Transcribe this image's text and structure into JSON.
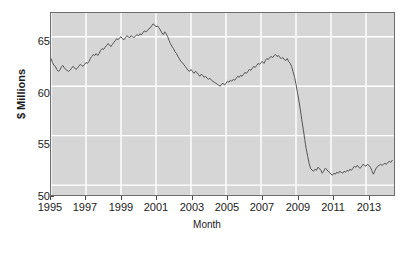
{
  "chart_data": {
    "type": "line",
    "title": "",
    "xlabel": "Month",
    "ylabel": "$ Millions",
    "xlim": [
      1995.0,
      2014.6
    ],
    "ylim": [
      49.0,
      67.4
    ],
    "grid": true,
    "legend": null,
    "x_ticks": [
      "1995",
      "1997",
      "1999",
      "2001",
      "2003",
      "2005",
      "2007",
      "2009",
      "2011",
      "2013"
    ],
    "x_tick_values": [
      1995,
      1997,
      1999,
      2001,
      2003,
      2005,
      2007,
      2009,
      2011,
      2013
    ],
    "y_ticks": [
      "50",
      "55",
      "60",
      "65"
    ],
    "y_tick_values": [
      50,
      55,
      60,
      65
    ],
    "series": [
      {
        "name": "Monthly value",
        "color": "#555555",
        "x": [
          1995.0,
          1995.08,
          1995.17,
          1995.25,
          1995.33,
          1995.42,
          1995.5,
          1995.58,
          1995.67,
          1995.75,
          1995.83,
          1995.92,
          1996.0,
          1996.08,
          1996.17,
          1996.25,
          1996.33,
          1996.42,
          1996.5,
          1996.58,
          1996.67,
          1996.75,
          1996.83,
          1996.92,
          1997.0,
          1997.08,
          1997.17,
          1997.25,
          1997.33,
          1997.42,
          1997.5,
          1997.58,
          1997.67,
          1997.75,
          1997.83,
          1997.92,
          1998.0,
          1998.08,
          1998.17,
          1998.25,
          1998.33,
          1998.42,
          1998.5,
          1998.58,
          1998.67,
          1998.75,
          1998.83,
          1998.92,
          1999.0,
          1999.08,
          1999.17,
          1999.25,
          1999.33,
          1999.42,
          1999.5,
          1999.58,
          1999.67,
          1999.75,
          1999.83,
          1999.92,
          2000.0,
          2000.08,
          2000.17,
          2000.25,
          2000.33,
          2000.42,
          2000.5,
          2000.58,
          2000.67,
          2000.75,
          2000.83,
          2000.92,
          2001.0,
          2001.08,
          2001.17,
          2001.25,
          2001.33,
          2001.42,
          2001.5,
          2001.58,
          2001.67,
          2001.75,
          2001.83,
          2001.92,
          2002.0,
          2002.08,
          2002.17,
          2002.25,
          2002.33,
          2002.42,
          2002.5,
          2002.58,
          2002.67,
          2002.75,
          2002.83,
          2002.92,
          2003.0,
          2003.08,
          2003.17,
          2003.25,
          2003.33,
          2003.42,
          2003.5,
          2003.58,
          2003.67,
          2003.75,
          2003.83,
          2003.92,
          2004.0,
          2004.08,
          2004.17,
          2004.25,
          2004.33,
          2004.42,
          2004.5,
          2004.58,
          2004.67,
          2004.75,
          2004.83,
          2004.92,
          2005.0,
          2005.08,
          2005.17,
          2005.25,
          2005.33,
          2005.42,
          2005.5,
          2005.58,
          2005.67,
          2005.75,
          2005.83,
          2005.92,
          2006.0,
          2006.08,
          2006.17,
          2006.25,
          2006.33,
          2006.42,
          2006.5,
          2006.58,
          2006.67,
          2006.75,
          2006.83,
          2006.92,
          2007.0,
          2007.08,
          2007.17,
          2007.25,
          2007.33,
          2007.42,
          2007.5,
          2007.58,
          2007.67,
          2007.75,
          2007.83,
          2007.92,
          2008.0,
          2008.08,
          2008.17,
          2008.25,
          2008.33,
          2008.42,
          2008.5,
          2008.58,
          2008.67,
          2008.75,
          2008.83,
          2008.92,
          2009.0,
          2009.08,
          2009.17,
          2009.25,
          2009.33,
          2009.42,
          2009.5,
          2009.58,
          2009.67,
          2009.75,
          2009.83,
          2009.92,
          2010.0,
          2010.08,
          2010.17,
          2010.25,
          2010.33,
          2010.42,
          2010.5,
          2010.58,
          2010.67,
          2010.75,
          2010.83,
          2010.92,
          2011.0,
          2011.08,
          2011.17,
          2011.25,
          2011.33,
          2011.42,
          2011.5,
          2011.58,
          2011.67,
          2011.75,
          2011.83,
          2011.92,
          2012.0,
          2012.08,
          2012.17,
          2012.25,
          2012.33,
          2012.42,
          2012.5,
          2012.58,
          2012.67,
          2012.75,
          2012.83,
          2012.92,
          2013.0,
          2013.08,
          2013.17,
          2013.25,
          2013.33,
          2013.42,
          2013.5,
          2013.58,
          2013.67,
          2013.75,
          2013.83,
          2013.92,
          2014.0,
          2014.08,
          2014.17,
          2014.25,
          2014.33,
          2014.42,
          2014.5
        ],
        "values": [
          62.8,
          62.4,
          62.1,
          62.0,
          61.7,
          61.5,
          61.6,
          61.9,
          62.1,
          61.9,
          61.7,
          61.6,
          61.5,
          61.6,
          61.8,
          62.0,
          61.9,
          61.7,
          61.8,
          62.0,
          62.2,
          62.1,
          62.0,
          62.2,
          62.4,
          62.3,
          62.5,
          62.8,
          63.0,
          63.2,
          63.1,
          63.3,
          63.1,
          63.3,
          63.6,
          63.8,
          63.7,
          63.9,
          64.1,
          64.3,
          64.2,
          64.0,
          64.2,
          64.4,
          64.6,
          64.8,
          64.7,
          64.9,
          65.0,
          64.8,
          64.7,
          64.9,
          65.1,
          65.0,
          64.9,
          65.1,
          65.0,
          64.9,
          65.1,
          65.2,
          65.1,
          65.3,
          65.2,
          65.4,
          65.6,
          65.5,
          65.6,
          65.8,
          65.9,
          66.1,
          66.3,
          66.2,
          66.0,
          66.1,
          65.9,
          65.7,
          65.4,
          65.2,
          65.5,
          65.3,
          65.0,
          64.6,
          64.3,
          64.0,
          63.8,
          63.5,
          63.3,
          63.0,
          62.8,
          62.5,
          62.4,
          62.2,
          62.0,
          61.8,
          61.6,
          61.5,
          61.7,
          61.5,
          61.3,
          61.5,
          61.4,
          61.2,
          61.0,
          61.2,
          61.1,
          60.9,
          61.0,
          60.8,
          60.7,
          60.8,
          60.6,
          60.5,
          60.4,
          60.3,
          60.2,
          60.1,
          60.0,
          60.2,
          60.3,
          60.1,
          60.3,
          60.5,
          60.4,
          60.6,
          60.5,
          60.7,
          60.6,
          60.8,
          61.0,
          60.9,
          61.1,
          61.0,
          61.2,
          61.4,
          61.3,
          61.5,
          61.7,
          61.6,
          61.8,
          62.0,
          61.9,
          62.1,
          62.3,
          62.2,
          62.4,
          62.5,
          62.3,
          62.6,
          62.8,
          62.7,
          62.9,
          63.0,
          62.9,
          63.1,
          63.2,
          63.0,
          63.1,
          62.9,
          62.8,
          62.9,
          62.7,
          62.6,
          62.8,
          62.5,
          62.3,
          62.0,
          61.5,
          60.9,
          60.2,
          59.4,
          58.5,
          57.6,
          56.6,
          55.6,
          54.6,
          53.7,
          52.9,
          52.2,
          51.7,
          51.5,
          51.4,
          51.6,
          51.5,
          51.8,
          51.7,
          51.5,
          51.2,
          51.4,
          51.7,
          51.6,
          51.4,
          51.3,
          51.1,
          51.0,
          51.2,
          51.1,
          51.3,
          51.2,
          51.4,
          51.3,
          51.2,
          51.4,
          51.3,
          51.5,
          51.4,
          51.6,
          51.5,
          51.7,
          51.9,
          51.8,
          52.0,
          51.8,
          51.7,
          51.9,
          52.1,
          52.0,
          51.9,
          52.1,
          52.0,
          51.8,
          51.5,
          51.1,
          51.4,
          51.7,
          51.9,
          52.0,
          52.1,
          52.0,
          52.1,
          52.2,
          52.1,
          52.3,
          52.4,
          52.3,
          52.5
        ]
      }
    ]
  },
  "axes": {
    "y_title": "$ Millions",
    "x_title": "Month",
    "y_tick_labels": [
      "65",
      "60",
      "55",
      "50"
    ],
    "x_tick_labels": [
      "1995",
      "1997",
      "1999",
      "2001",
      "2003",
      "2005",
      "2007",
      "2009",
      "2011",
      "2013"
    ]
  },
  "colors": {
    "panel_background": "#d6d6d6",
    "gridline": "#ffffff",
    "line": "#555555",
    "frame": "#6d6d6d",
    "text": "#1a1a1a",
    "page_background": "#ffffff"
  }
}
